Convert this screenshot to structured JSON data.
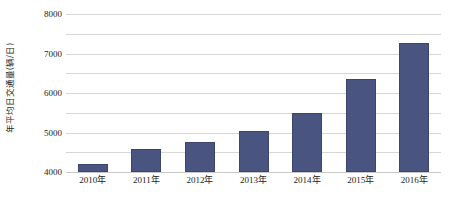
{
  "chart_data": {
    "type": "bar",
    "title": "",
    "xlabel": "",
    "ylabel": "年平均日交通量(辆/日)",
    "categories": [
      "2010年",
      "2011年",
      "2012年",
      "2013年",
      "2014年",
      "2015年",
      "2016年"
    ],
    "values": [
      400,
      1150,
      1500,
      2100,
      3000,
      4700,
      6550
    ],
    "ylim": [
      0,
      8000
    ],
    "ytick_labels": [
      "0",
      "1000",
      "2000",
      "3000",
      "4000",
      "5000",
      "6000",
      "7000",
      "8000"
    ],
    "ytick_values": [
      0,
      1000,
      2000,
      3000,
      4000,
      5000,
      6000,
      7000,
      8000
    ],
    "grid": true,
    "legend": null,
    "series_color": "#4a5480",
    "gridline_color": "#d6d6d6"
  }
}
